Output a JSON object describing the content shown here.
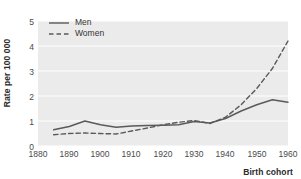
{
  "chart_data": {
    "type": "line",
    "title": "",
    "subtitle": "",
    "xlabel": "Birth cohort",
    "ylabel": "Rate per 100 000",
    "xlim": [
      1880,
      1960
    ],
    "ylim": [
      0,
      5
    ],
    "grid": "horizontal",
    "legend_position": "top-left",
    "x_ticks": [
      "1880",
      "1890",
      "1900",
      "1910",
      "1920",
      "1930",
      "1940",
      "1950",
      "1960"
    ],
    "y_ticks": [
      "0",
      "1",
      "2",
      "3",
      "4",
      "5"
    ],
    "colors": {
      "men_line": "#5a5a5a",
      "women_line": "#5a5a5a",
      "plot_background": "#ebebeb",
      "gridline": "#ffffff",
      "page_background": "#ffffff",
      "tick_text": "#4a4a4a",
      "axis_title_text": "#2b2b2b"
    },
    "series": [
      {
        "name": "Men",
        "style": "solid",
        "x": [
          1885,
          1890,
          1895,
          1900,
          1905,
          1910,
          1915,
          1920,
          1925,
          1930,
          1935,
          1940,
          1945,
          1950,
          1955,
          1960
        ],
        "values": [
          0.65,
          0.78,
          1.0,
          0.85,
          0.75,
          0.8,
          0.82,
          0.83,
          0.85,
          0.98,
          0.92,
          1.1,
          1.4,
          1.65,
          1.85,
          1.75
        ]
      },
      {
        "name": "Women",
        "style": "dashed",
        "x": [
          1885,
          1890,
          1895,
          1900,
          1905,
          1910,
          1915,
          1920,
          1925,
          1930,
          1935,
          1940,
          1945,
          1950,
          1955,
          1960
        ],
        "values": [
          0.45,
          0.5,
          0.52,
          0.5,
          0.48,
          0.6,
          0.72,
          0.85,
          0.95,
          1.02,
          0.9,
          1.15,
          1.65,
          2.3,
          3.1,
          4.2
        ]
      }
    ]
  },
  "legend": {
    "entries": [
      {
        "label": "Men",
        "style": "solid"
      },
      {
        "label": "Women",
        "style": "dashed"
      }
    ]
  },
  "axes": {
    "y_title": "Rate per 100 000",
    "x_title": "Birth cohort",
    "y_tick_labels": [
      "5",
      "4",
      "3",
      "2",
      "1",
      "0"
    ],
    "x_tick_labels": [
      "1880",
      "1890",
      "1900",
      "1910",
      "1920",
      "1930",
      "1940",
      "1950",
      "1960"
    ]
  }
}
